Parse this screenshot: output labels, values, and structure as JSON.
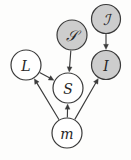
{
  "figure": {
    "kind": "directed-graphical-model",
    "background_color": "#fdfdfc",
    "stroke_color": "#3a3a3a",
    "shaded_fill": "#cdcdcd",
    "unshaded_fill": "#ffffff"
  },
  "nodes": [
    {
      "id": "script-I",
      "label": "ℐ",
      "label_style": "script",
      "shaded": true,
      "cx": 106,
      "cy": 19,
      "r": 14.5
    },
    {
      "id": "script-S",
      "label": "𝒮",
      "label_style": "script",
      "shaded": true,
      "cx": 72,
      "cy": 35,
      "r": 15
    },
    {
      "id": "L",
      "label": "L",
      "label_style": "plain",
      "shaded": false,
      "cx": 26,
      "cy": 65,
      "r": 15
    },
    {
      "id": "I",
      "label": "I",
      "label_style": "plain",
      "shaded": true,
      "cx": 106,
      "cy": 65,
      "r": 14.5
    },
    {
      "id": "S",
      "label": "S",
      "label_style": "plain",
      "shaded": false,
      "cx": 68,
      "cy": 88,
      "r": 15
    },
    {
      "id": "m",
      "label": "m",
      "label_style": "lower",
      "shaded": false,
      "cx": 67,
      "cy": 133,
      "r": 15
    }
  ],
  "edges": [
    {
      "id": "edge-scriptI-to-I",
      "from": "script-I",
      "to": "I"
    },
    {
      "id": "edge-scriptS-to-S",
      "from": "script-S",
      "to": "S"
    },
    {
      "id": "edge-L-to-S",
      "from": "L",
      "to": "S"
    },
    {
      "id": "edge-m-to-L",
      "from": "m",
      "to": "L"
    },
    {
      "id": "edge-m-to-S",
      "from": "m",
      "to": "S"
    },
    {
      "id": "edge-m-to-I",
      "from": "m",
      "to": "I"
    }
  ]
}
